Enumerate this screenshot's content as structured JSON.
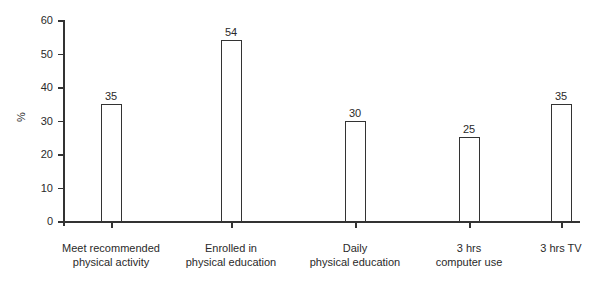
{
  "chart_data": {
    "type": "bar",
    "title": "",
    "xlabel": "",
    "ylabel": "%",
    "ylim": [
      0,
      60
    ],
    "yticks": [
      0,
      10,
      20,
      30,
      40,
      50,
      60
    ],
    "grid": false,
    "legend": null,
    "categories": [
      "Meet recommended physical activity",
      "Enrolled in physical education",
      "Daily physical education",
      "3 hrs computer use",
      "3 hrs TV"
    ],
    "category_lines": [
      [
        "Meet recommended",
        "physical activity"
      ],
      [
        "Enrolled in",
        "physical education"
      ],
      [
        "Daily",
        "physical education"
      ],
      [
        "3 hrs",
        "computer use"
      ],
      [
        "3 hrs TV"
      ]
    ],
    "values": [
      35,
      54,
      30,
      25,
      35
    ],
    "data_labels": [
      "35",
      "54",
      "30",
      "25",
      "35"
    ]
  }
}
